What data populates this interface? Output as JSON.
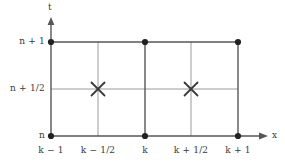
{
  "figure": {
    "background_color": "#ffffff",
    "ink_color": "#3a3a3a",
    "major_line_color": "#565656",
    "minor_line_color": "#9a9a9a",
    "node_color": "#222222",
    "marker_color": "#3a3a3a",
    "axes": {
      "vertical": {
        "name": "t",
        "label": "t"
      },
      "horizontal": {
        "name": "x",
        "label": "x"
      }
    },
    "y_ticks": [
      {
        "label": "n + 1",
        "value": "n+1",
        "y": 42,
        "major": true
      },
      {
        "label": "n + 1/2",
        "value": "n+1/2",
        "y": 89,
        "major": false
      },
      {
        "label": "n",
        "value": "n",
        "y": 136,
        "major": true
      }
    ],
    "x_ticks": [
      {
        "label": "k − 1",
        "value": "k-1",
        "x": 51,
        "major": true
      },
      {
        "label": "k − 1/2",
        "value": "k-1/2",
        "x": 98,
        "major": false
      },
      {
        "label": "k",
        "value": "k",
        "x": 145,
        "major": true
      },
      {
        "label": "k + 1/2",
        "value": "k+1/2",
        "x": 191,
        "major": false
      },
      {
        "label": "k + 1",
        "value": "k+1",
        "x": 238,
        "major": true
      }
    ],
    "nodes": [
      {
        "name": "node-k-1-n-1",
        "x": 51,
        "y": 42
      },
      {
        "name": "node-k-n-1",
        "x": 145,
        "y": 42
      },
      {
        "name": "node-k-1-plus-n-1",
        "x": 238,
        "y": 42
      },
      {
        "name": "node-k-1-n",
        "x": 51,
        "y": 136
      },
      {
        "name": "node-k-n",
        "x": 145,
        "y": 136
      },
      {
        "name": "node-k-1-plus-n",
        "x": 238,
        "y": 136
      }
    ],
    "cross_markers": [
      {
        "name": "cross-marker-k-minus-half",
        "x": 98,
        "y": 89,
        "size": 8
      },
      {
        "name": "cross-marker-k-plus-half",
        "x": 191,
        "y": 89,
        "size": 8
      }
    ]
  }
}
